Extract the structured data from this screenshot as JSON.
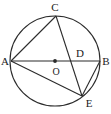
{
  "figure": {
    "type": "circle-geometry-diagram",
    "background_color": "#ffffff",
    "stroke_color": "#2b2b2b",
    "label_color": "#1a1a1a",
    "canvas": {
      "width": 111,
      "height": 114
    },
    "circle": {
      "name": "main-circle",
      "center_x": 55,
      "center_y": 61,
      "radius": 45
    },
    "center_dot": {
      "name": "center-point-o",
      "x": 55,
      "y": 61,
      "radius": 1.9
    },
    "points": [
      {
        "id": "A",
        "label": "A",
        "x": 11,
        "y": 61,
        "label_x": 5,
        "label_y": 65,
        "anchor": "middle"
      },
      {
        "id": "B",
        "label": "B",
        "x": 100,
        "y": 61,
        "label_x": 106,
        "label_y": 65,
        "anchor": "middle"
      },
      {
        "id": "C",
        "label": "C",
        "x": 56,
        "y": 16,
        "label_x": 55,
        "label_y": 11,
        "anchor": "middle"
      },
      {
        "id": "D",
        "label": "D",
        "x": 75,
        "y": 61,
        "label_x": 80,
        "label_y": 57,
        "anchor": "middle"
      },
      {
        "id": "E",
        "label": "E",
        "x": 82,
        "y": 96,
        "label_x": 89,
        "label_y": 107,
        "anchor": "middle"
      },
      {
        "id": "O",
        "label": "O",
        "x": 55,
        "y": 61,
        "label_x": 56,
        "label_y": 75,
        "anchor": "middle"
      }
    ],
    "segments": [
      {
        "id": "AB",
        "name": "segment-a-b",
        "x1": 11,
        "y1": 61,
        "x2": 100,
        "y2": 61
      },
      {
        "id": "AC",
        "name": "segment-a-c",
        "x1": 11,
        "y1": 61,
        "x2": 56,
        "y2": 16
      },
      {
        "id": "CE",
        "name": "segment-c-e",
        "x1": 56,
        "y1": 16,
        "x2": 82,
        "y2": 96
      },
      {
        "id": "AE",
        "name": "segment-a-e",
        "x1": 11,
        "y1": 61,
        "x2": 82,
        "y2": 96
      },
      {
        "id": "BE",
        "name": "segment-b-e",
        "x1": 100,
        "y1": 61,
        "x2": 82,
        "y2": 96
      }
    ]
  }
}
